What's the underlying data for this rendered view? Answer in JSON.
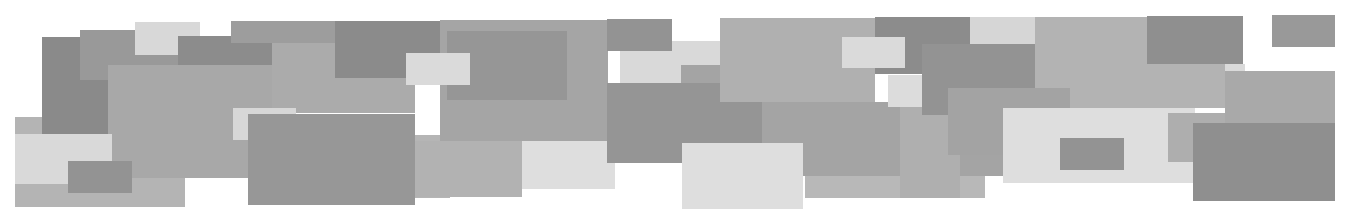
{
  "canvas": {
    "width": 1354,
    "height": 210,
    "background": "#ffffff"
  },
  "rects": [
    {
      "x": 15,
      "y": 117,
      "w": 170,
      "h": 90,
      "color": "#b4b4b4"
    },
    {
      "x": 42,
      "y": 37,
      "w": 66,
      "h": 97,
      "color": "#8a8a8a"
    },
    {
      "x": 80,
      "y": 30,
      "w": 98,
      "h": 50,
      "color": "#999999"
    },
    {
      "x": 108,
      "y": 65,
      "w": 167,
      "h": 113,
      "color": "#a8a8a8"
    },
    {
      "x": 135,
      "y": 22,
      "w": 65,
      "h": 33,
      "color": "#d8d8d8"
    },
    {
      "x": 178,
      "y": 36,
      "w": 120,
      "h": 29,
      "color": "#8c8c8c"
    },
    {
      "x": 15,
      "y": 134,
      "w": 97,
      "h": 50,
      "color": "#d9d9d9"
    },
    {
      "x": 68,
      "y": 161,
      "w": 64,
      "h": 32,
      "color": "#939393"
    },
    {
      "x": 231,
      "y": 21,
      "w": 219,
      "h": 22,
      "color": "#9d9d9d"
    },
    {
      "x": 272,
      "y": 43,
      "w": 143,
      "h": 70,
      "color": "#ababab"
    },
    {
      "x": 335,
      "y": 21,
      "w": 112,
      "h": 57,
      "color": "#8b8b8b"
    },
    {
      "x": 415,
      "y": 135,
      "w": 35,
      "h": 63,
      "color": "#b5b5b5"
    },
    {
      "x": 233,
      "y": 108,
      "w": 63,
      "h": 32,
      "color": "#d7d7d7"
    },
    {
      "x": 248,
      "y": 114,
      "w": 167,
      "h": 91,
      "color": "#979797"
    },
    {
      "x": 440,
      "y": 20,
      "w": 168,
      "h": 121,
      "color": "#a5a5a5"
    },
    {
      "x": 447,
      "y": 31,
      "w": 120,
      "h": 69,
      "color": "#969696"
    },
    {
      "x": 406,
      "y": 53,
      "w": 64,
      "h": 32,
      "color": "#dadada"
    },
    {
      "x": 415,
      "y": 141,
      "w": 107,
      "h": 56,
      "color": "#b2b2b2"
    },
    {
      "x": 522,
      "y": 141,
      "w": 93,
      "h": 48,
      "color": "#dedede"
    },
    {
      "x": 620,
      "y": 41,
      "w": 100,
      "h": 42,
      "color": "#d9d9d9"
    },
    {
      "x": 607,
      "y": 19,
      "w": 65,
      "h": 32,
      "color": "#939393"
    },
    {
      "x": 681,
      "y": 65,
      "w": 39,
      "h": 35,
      "color": "#a4a4a4"
    },
    {
      "x": 607,
      "y": 83,
      "w": 155,
      "h": 80,
      "color": "#959595"
    },
    {
      "x": 720,
      "y": 18,
      "w": 155,
      "h": 84,
      "color": "#b0b0b0"
    },
    {
      "x": 762,
      "y": 102,
      "w": 246,
      "h": 74,
      "color": "#a4a4a4"
    },
    {
      "x": 805,
      "y": 176,
      "w": 180,
      "h": 22,
      "color": "#b8b8b8"
    },
    {
      "x": 682,
      "y": 143,
      "w": 121,
      "h": 66,
      "color": "#dedede"
    },
    {
      "x": 875,
      "y": 17,
      "w": 95,
      "h": 57,
      "color": "#8c8c8c"
    },
    {
      "x": 842,
      "y": 37,
      "w": 63,
      "h": 31,
      "color": "#dadada"
    },
    {
      "x": 900,
      "y": 107,
      "w": 60,
      "h": 91,
      "color": "#afafaf"
    },
    {
      "x": 888,
      "y": 75,
      "w": 34,
      "h": 32,
      "color": "#dcdcdc"
    },
    {
      "x": 970,
      "y": 17,
      "w": 65,
      "h": 27,
      "color": "#d6d6d6"
    },
    {
      "x": 922,
      "y": 44,
      "w": 113,
      "h": 71,
      "color": "#939393"
    },
    {
      "x": 1035,
      "y": 17,
      "w": 190,
      "h": 91,
      "color": "#b3b3b3"
    },
    {
      "x": 948,
      "y": 88,
      "w": 122,
      "h": 67,
      "color": "#a3a3a3"
    },
    {
      "x": 1003,
      "y": 108,
      "w": 192,
      "h": 75,
      "color": "#dedede"
    },
    {
      "x": 1060,
      "y": 138,
      "w": 64,
      "h": 32,
      "color": "#939393"
    },
    {
      "x": 1147,
      "y": 16,
      "w": 96,
      "h": 48,
      "color": "#8f8f8f"
    },
    {
      "x": 1225,
      "y": 64,
      "w": 20,
      "h": 48,
      "color": "#dadada"
    },
    {
      "x": 1168,
      "y": 113,
      "w": 97,
      "h": 49,
      "color": "#aeaeae"
    },
    {
      "x": 1225,
      "y": 71,
      "w": 110,
      "h": 52,
      "color": "#a9a9a9"
    },
    {
      "x": 1193,
      "y": 123,
      "w": 142,
      "h": 78,
      "color": "#8f8f8f"
    },
    {
      "x": 1272,
      "y": 15,
      "w": 63,
      "h": 32,
      "color": "#999999"
    }
  ]
}
